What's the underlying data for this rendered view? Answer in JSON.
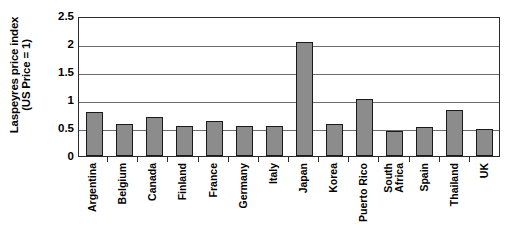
{
  "chart_data": {
    "type": "bar",
    "title": "",
    "xlabel": "",
    "ylabel": "Laspeyres price index (US Price = 1)",
    "ylabel_lines": [
      "Laspeyres price index",
      "(US Price = 1)"
    ],
    "ylim": [
      0,
      2.5
    ],
    "yticks": [
      0,
      0.5,
      1,
      1.5,
      2,
      2.5
    ],
    "ytick_labels": [
      "0",
      "0.5",
      "1",
      "1.5",
      "2",
      "2.5"
    ],
    "grid": true,
    "grid_axis": "y",
    "legend": false,
    "bar_color": "#8c8c8c",
    "bar_edge_color": "#1a1a1a",
    "categories": [
      "Argentina",
      "Belgium",
      "Canada",
      "Finland",
      "France",
      "Germany",
      "Italy",
      "Japan",
      "Korea",
      "Puerto Rico",
      "South Africa",
      "Spain",
      "Thailand",
      "UK"
    ],
    "category_label_lines": [
      [
        "Argentina"
      ],
      [
        "Belgium"
      ],
      [
        "Canada"
      ],
      [
        "Finland"
      ],
      [
        "France"
      ],
      [
        "Germany"
      ],
      [
        "Italy"
      ],
      [
        "Japan"
      ],
      [
        "Korea"
      ],
      [
        "Puerto Rico"
      ],
      [
        "South",
        "Africa"
      ],
      [
        "Spain"
      ],
      [
        "Thailand"
      ],
      [
        "UK"
      ]
    ],
    "values": [
      0.79,
      0.57,
      0.7,
      0.54,
      0.63,
      0.54,
      0.54,
      2.03,
      0.57,
      1.01,
      0.44,
      0.52,
      0.83,
      0.48
    ]
  }
}
